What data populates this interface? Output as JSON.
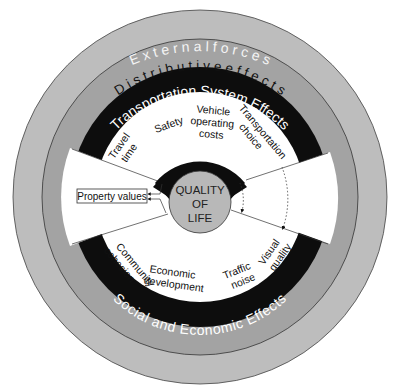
{
  "diagram": {
    "colors": {
      "outer_ring": "#bdbdbd",
      "middle_ring": "#a3a3a3",
      "black_band": "#0d0d0d",
      "inner_white": "#ffffff",
      "center_circle": "#b8b8b8",
      "outline": "#333333"
    },
    "rings": {
      "outer": {
        "label": "E x t e r n a l   f o r c e s"
      },
      "middle": {
        "label": "D i s t r i b u t i v e   e f f e c t s"
      },
      "top_band": {
        "label": "Transportation System Effects"
      },
      "bottom_band": {
        "label": "Social and Economic Effects"
      },
      "inner_band": {
        "label": "Accessibility"
      }
    },
    "center": {
      "line1": "QUALITY",
      "line2": "OF",
      "line3": "LIFE"
    },
    "transportation_effects": [
      {
        "line1": "Travel",
        "line2": "time"
      },
      {
        "line1": "Safety",
        "line2": ""
      },
      {
        "line1": "Vehicle",
        "line2": "operating",
        "line3": "costs"
      },
      {
        "line1": "Transportation",
        "line2": "choice"
      }
    ],
    "social_economic_effects": [
      {
        "line1": "Community",
        "line2": "cohesion"
      },
      {
        "line1": "Economic",
        "line2": "development"
      },
      {
        "line1": "Traffic",
        "line2": "noise"
      },
      {
        "line1": "Visual",
        "line2": "quality"
      }
    ],
    "left_wedge": {
      "label": "Property values"
    }
  }
}
